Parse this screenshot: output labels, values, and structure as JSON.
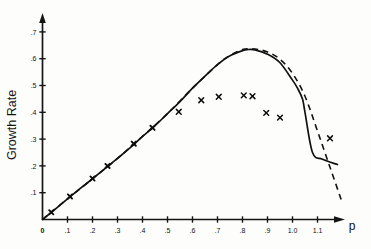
{
  "figure": {
    "background_color": "#fdfdfc",
    "ink_color": "#101010",
    "y_axis_title": "Growth Rate",
    "x_axis_title": "p"
  },
  "chart_data": {
    "type": "line",
    "title": "",
    "subtitle": "",
    "xlabel": "p",
    "ylabel": "Growth Rate",
    "xlim": [
      0,
      1.2
    ],
    "ylim": [
      0,
      0.75
    ],
    "grid": false,
    "legend": "none",
    "x_ticks": [
      "0",
      ".1",
      ".2",
      ".3",
      ".4",
      ".5",
      ".6",
      ".7",
      ".8",
      ".9",
      "1.0",
      "1.1"
    ],
    "x_tick_values": [
      0,
      0.1,
      0.2,
      0.3,
      0.4,
      0.5,
      0.6,
      0.7,
      0.8,
      0.9,
      1.0,
      1.1
    ],
    "y_ticks": [
      ".1",
      ".2",
      ".3",
      ".4",
      ".5",
      ".6",
      ".7"
    ],
    "y_tick_values": [
      0.1,
      0.2,
      0.3,
      0.4,
      0.5,
      0.6,
      0.7
    ],
    "series": [
      {
        "name": "solid-curve",
        "style": "solid",
        "x": [
          0.0,
          0.05,
          0.1,
          0.15,
          0.2,
          0.25,
          0.3,
          0.35,
          0.4,
          0.45,
          0.5,
          0.55,
          0.6,
          0.65,
          0.7,
          0.75,
          0.8,
          0.82,
          0.85,
          0.9,
          0.95,
          1.0,
          1.02,
          1.04,
          1.05,
          1.08,
          1.12,
          1.18
        ],
        "values": [
          0.0,
          0.038,
          0.077,
          0.115,
          0.152,
          0.19,
          0.228,
          0.267,
          0.31,
          0.35,
          0.395,
          0.44,
          0.49,
          0.535,
          0.578,
          0.611,
          0.63,
          0.634,
          0.633,
          0.617,
          0.585,
          0.52,
          0.49,
          0.45,
          0.4,
          0.25,
          0.225,
          0.205
        ]
      },
      {
        "name": "dashed-curve",
        "style": "dashed",
        "x": [
          0.0,
          0.1,
          0.2,
          0.3,
          0.4,
          0.5,
          0.6,
          0.7,
          0.75,
          0.8,
          0.85,
          0.9,
          0.95,
          1.0,
          1.05,
          1.1,
          1.15,
          1.2
        ],
        "values": [
          0.0,
          0.077,
          0.152,
          0.228,
          0.31,
          0.395,
          0.49,
          0.578,
          0.612,
          0.634,
          0.636,
          0.625,
          0.598,
          0.545,
          0.46,
          0.33,
          0.195,
          0.06
        ]
      }
    ],
    "scatter": {
      "name": "data-points",
      "marker": "x",
      "points_on_line": [
        {
          "x": 0.035,
          "y": 0.027
        },
        {
          "x": 0.11,
          "y": 0.086
        },
        {
          "x": 0.2,
          "y": 0.153
        },
        {
          "x": 0.26,
          "y": 0.2
        },
        {
          "x": 0.365,
          "y": 0.283
        },
        {
          "x": 0.44,
          "y": 0.342
        }
      ],
      "points_below_line": [
        {
          "x": 0.545,
          "y": 0.402
        },
        {
          "x": 0.635,
          "y": 0.445
        },
        {
          "x": 0.705,
          "y": 0.458
        },
        {
          "x": 0.805,
          "y": 0.463
        },
        {
          "x": 0.84,
          "y": 0.46
        },
        {
          "x": 0.895,
          "y": 0.398
        },
        {
          "x": 0.95,
          "y": 0.38
        },
        {
          "x": 1.15,
          "y": 0.303
        }
      ]
    }
  }
}
